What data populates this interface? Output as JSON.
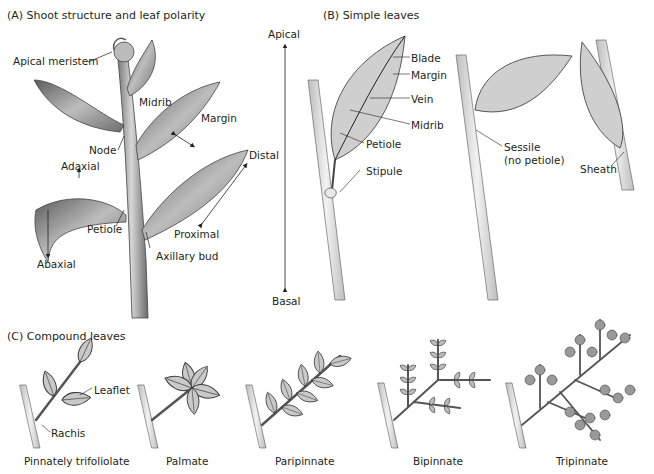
{
  "panel_a": {
    "title": "(A)  Shoot structure and leaf polarity",
    "labels": {
      "apical_meristem": "Apical meristem",
      "midrib": "Midrib",
      "margin": "Margin",
      "node": "Node",
      "adaxial": "Adaxial",
      "petiole": "Petiole",
      "abaxial": "Abaxial",
      "distal": "Distal",
      "proximal": "Proximal",
      "axillary_bud": "Axillary bud"
    },
    "axis": {
      "top": "Apical",
      "bottom": "Basal"
    }
  },
  "panel_b": {
    "title": "(B)  Simple leaves",
    "labels": {
      "blade": "Blade",
      "margin": "Margin",
      "vein": "Vein",
      "midrib": "Midrib",
      "petiole": "Petiole",
      "stipule": "Stipule",
      "sessile": "Sessile",
      "sessile_note": "(no petiole)",
      "sheath": "Sheath"
    }
  },
  "panel_c": {
    "title": "(C)  Compound leaves",
    "labels": {
      "leaflet": "Leaflet",
      "rachis": "Rachis"
    },
    "types": [
      "Pinnately trifoliolate",
      "Palmate",
      "Paripinnate",
      "Bipinnate",
      "Tripinnate"
    ]
  },
  "colors": {
    "leaf_fill": "#c9c9c9",
    "leaf_stroke": "#3a3a3a",
    "stem": "#b8b8b8",
    "text": "#231f20"
  }
}
